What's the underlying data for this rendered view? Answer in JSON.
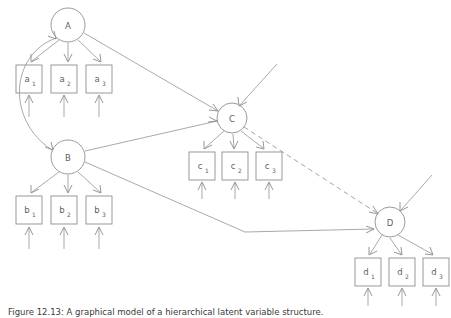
{
  "figure": {
    "caption": "Figure 12.13: A graphical model of a hierarchical latent variable structure.",
    "background_color": "#ffffff",
    "line_color": "#9a9a9a",
    "text_color": "#5f5f5f"
  },
  "diagram": {
    "type": "directed-graph",
    "nodes": [
      {
        "id": "A",
        "label": "A",
        "shape": "circle",
        "cx": 68,
        "cy": 25,
        "r": 17
      },
      {
        "id": "B",
        "label": "B",
        "shape": "circle",
        "cx": 68,
        "cy": 157,
        "r": 17
      },
      {
        "id": "C",
        "label": "C",
        "shape": "circle",
        "cx": 232,
        "cy": 118,
        "r": 15
      },
      {
        "id": "D",
        "label": "D",
        "shape": "circle",
        "cx": 390,
        "cy": 222,
        "r": 15
      }
    ],
    "observed": [
      {
        "id": "a1",
        "base": "a",
        "sub": "1",
        "x": 16,
        "y": 65,
        "w": 26,
        "h": 28
      },
      {
        "id": "a2",
        "base": "a",
        "sub": "2",
        "x": 51,
        "y": 65,
        "w": 26,
        "h": 28
      },
      {
        "id": "a3",
        "base": "a",
        "sub": "3",
        "x": 86,
        "y": 65,
        "w": 26,
        "h": 28
      },
      {
        "id": "b1",
        "base": "b",
        "sub": "1",
        "x": 16,
        "y": 196,
        "w": 26,
        "h": 28
      },
      {
        "id": "b2",
        "base": "b",
        "sub": "2",
        "x": 51,
        "y": 196,
        "w": 26,
        "h": 28
      },
      {
        "id": "b3",
        "base": "b",
        "sub": "3",
        "x": 86,
        "y": 196,
        "w": 26,
        "h": 28
      },
      {
        "id": "c1",
        "base": "c",
        "sub": "1",
        "x": 189,
        "y": 152,
        "w": 26,
        "h": 28
      },
      {
        "id": "c2",
        "base": "c",
        "sub": "2",
        "x": 222,
        "y": 152,
        "w": 26,
        "h": 28
      },
      {
        "id": "c3",
        "base": "c",
        "sub": "3",
        "x": 256,
        "y": 152,
        "w": 26,
        "h": 28
      },
      {
        "id": "d1",
        "base": "d",
        "sub": "1",
        "x": 355,
        "y": 258,
        "w": 26,
        "h": 28
      },
      {
        "id": "d2",
        "base": "d",
        "sub": "2",
        "x": 389,
        "y": 258,
        "w": 26,
        "h": 28
      },
      {
        "id": "d3",
        "base": "d",
        "sub": "3",
        "x": 423,
        "y": 258,
        "w": 26,
        "h": 28
      }
    ],
    "edges": [
      {
        "from": "A",
        "to": "a1",
        "style": "solid"
      },
      {
        "from": "A",
        "to": "a2",
        "style": "solid"
      },
      {
        "from": "A",
        "to": "a3",
        "style": "solid"
      },
      {
        "from": "B",
        "to": "b1",
        "style": "solid"
      },
      {
        "from": "B",
        "to": "b2",
        "style": "solid"
      },
      {
        "from": "B",
        "to": "b3",
        "style": "solid"
      },
      {
        "from": "C",
        "to": "c1",
        "style": "solid"
      },
      {
        "from": "C",
        "to": "c2",
        "style": "solid"
      },
      {
        "from": "C",
        "to": "c3",
        "style": "solid"
      },
      {
        "from": "D",
        "to": "d1",
        "style": "solid"
      },
      {
        "from": "D",
        "to": "d2",
        "style": "solid"
      },
      {
        "from": "D",
        "to": "d3",
        "style": "solid"
      },
      {
        "from": "A",
        "to": "C",
        "style": "solid"
      },
      {
        "from": "B",
        "to": "C",
        "style": "solid"
      },
      {
        "from": "B",
        "to": "D",
        "style": "solid",
        "routing": "bent"
      },
      {
        "from": "C",
        "to": "D",
        "style": "dashed"
      },
      {
        "from": "A",
        "to": "B",
        "style": "curved",
        "bidirectional": true
      },
      {
        "from": "external",
        "to": "C",
        "style": "solid"
      },
      {
        "from": "external",
        "to": "D",
        "style": "solid"
      },
      {
        "from": "external",
        "to": "a1",
        "style": "solid"
      },
      {
        "from": "external",
        "to": "a2",
        "style": "solid"
      },
      {
        "from": "external",
        "to": "a3",
        "style": "solid"
      },
      {
        "from": "external",
        "to": "b1",
        "style": "solid"
      },
      {
        "from": "external",
        "to": "b2",
        "style": "solid"
      },
      {
        "from": "external",
        "to": "b3",
        "style": "solid"
      },
      {
        "from": "external",
        "to": "c1",
        "style": "solid"
      },
      {
        "from": "external",
        "to": "c2",
        "style": "solid"
      },
      {
        "from": "external",
        "to": "c3",
        "style": "solid"
      },
      {
        "from": "external",
        "to": "d1",
        "style": "solid"
      },
      {
        "from": "external",
        "to": "d2",
        "style": "solid"
      },
      {
        "from": "external",
        "to": "d3",
        "style": "solid"
      }
    ]
  }
}
